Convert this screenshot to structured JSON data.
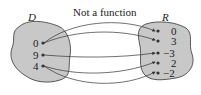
{
  "title": "Not a function",
  "domain_label": "D",
  "range_label": "R",
  "domain_values": [
    "0",
    "9",
    "4"
  ],
  "range_values": [
    "0",
    "3",
    "−3",
    "2",
    "−2"
  ],
  "mappings": [
    {
      "from": "0",
      "to": "0"
    },
    {
      "from": "0",
      "to": "3"
    },
    {
      "from": "9",
      "to": "−3"
    },
    {
      "from": "4",
      "to": "2"
    },
    {
      "from": "4",
      "to": "−2"
    }
  ],
  "colors": {
    "blob_fill": "#c8c8c8",
    "stroke": "#333333"
  }
}
